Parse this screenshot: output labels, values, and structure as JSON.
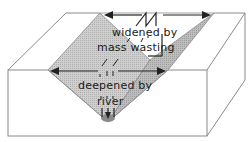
{
  "diagram": {
    "labels": {
      "widened_line1": "widened by",
      "widened_line2": "mass wasting",
      "deepened_line1": "deepened by",
      "deepened_line2": "river"
    },
    "colors": {
      "outline": "#777777",
      "valley_wall_left": "#c9c9c9",
      "valley_wall_right": "#b4b4b4",
      "arrow": "#222222",
      "river": "#8a8a8a",
      "background": "#ffffff"
    }
  }
}
